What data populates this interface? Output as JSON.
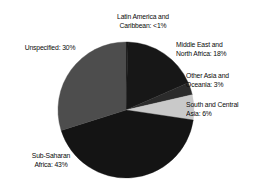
{
  "chart_data": {
    "type": "pie",
    "title": "",
    "subtitle": "",
    "xlabel": "",
    "ylabel": "",
    "legend_position": "none",
    "grid": false,
    "labels_placement": "outside-callout",
    "categories": [
      "Latin America and Caribbean",
      "Middle East and North Africa",
      "Other Asia and Oceania",
      "South and Central Asia",
      "Sub-Saharan Africa",
      "Unspecified"
    ],
    "values": [
      0.5,
      18,
      3,
      6,
      43,
      30
    ],
    "value_labels": [
      "<1%",
      "18%",
      "3%",
      "6%",
      "43%",
      "30%"
    ],
    "colors": [
      "#171717",
      "#171717",
      "#2b2b2b",
      "#c9c9c9",
      "#141414",
      "#4d4d4d"
    ],
    "start_angle_deg": 0,
    "direction": "clockwise"
  },
  "slices": [
    {
      "name": "latin-america",
      "label_line1": "Latin America and",
      "label_line2": "Caribbean: <1%",
      "value": 0.5,
      "value_text": "<1%",
      "color": "#171717"
    },
    {
      "name": "middle-east",
      "label_line1": "Middle East and",
      "label_line2": "North Africa: 18%",
      "value": 18,
      "value_text": "18%",
      "color": "#171717"
    },
    {
      "name": "other-asia",
      "label_line1": "Other Asia and",
      "label_line2": "Oceania: 3%",
      "value": 3,
      "value_text": "3%",
      "color": "#2b2b2b"
    },
    {
      "name": "south-central-asia",
      "label_line1": "South and Central",
      "label_line2": "Asia: 6%",
      "value": 6,
      "value_text": "6%",
      "color": "#c9c9c9"
    },
    {
      "name": "sub-saharan-africa",
      "label_line1": "Sub-Saharan",
      "label_line2": "Africa: 43%",
      "value": 43,
      "value_text": "43%",
      "color": "#141414"
    },
    {
      "name": "unspecified",
      "label_line1": "Unspecified: 30%",
      "label_line2": "",
      "value": 30,
      "value_text": "30%",
      "color": "#4d4d4d"
    }
  ],
  "labels": {
    "latin_america": "Latin America and\nCaribbean: <1%",
    "middle_east": "Middle East and\nNorth Africa: 18%",
    "other_asia": "Other Asia and\nOceania: 3%",
    "south_central_asia": "South and Central\nAsia: 6%",
    "sub_saharan_africa": "Sub-Saharan\nAfrica: 43%",
    "unspecified": "Unspecified: 30%"
  },
  "geometry": {
    "center_x": 126,
    "center_y": 110,
    "radius": 68
  },
  "palette": {
    "background": "#ffffff",
    "text": "#0a0a0a",
    "dark_slice": "#171717",
    "mid_dark_slice": "#2b2b2b",
    "mid_slice": "#4d4d4d",
    "light_slice": "#c9c9c9"
  }
}
